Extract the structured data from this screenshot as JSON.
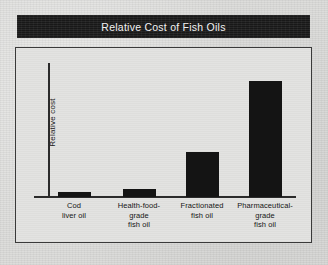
{
  "figure": {
    "title": "Relative Cost of Fish Oils"
  },
  "chart_data": {
    "type": "bar",
    "title": "Relative Cost of Fish Oils",
    "xlabel": "",
    "ylabel": "Relative cost",
    "categories": [
      "Cod liver oil",
      "Health-food-grade fish oil",
      "Fractionated fish oil",
      "Pharmaceutical-grade fish oil"
    ],
    "category_lines": [
      [
        "Cod",
        "liver oil"
      ],
      [
        "Health-food-",
        "grade",
        "fish oil"
      ],
      [
        "Fractionated",
        "fish oil"
      ],
      [
        "Pharmaceutical-",
        "grade",
        "fish oil"
      ]
    ],
    "values": [
      4,
      6,
      34,
      87
    ],
    "ylim": [
      0,
      100
    ],
    "grid": false,
    "legend": false,
    "axis_tick_labels": false,
    "bar_color": "#141414"
  }
}
